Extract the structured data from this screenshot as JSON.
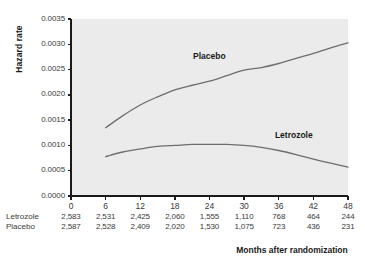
{
  "chart_data": {
    "type": "line",
    "title": "",
    "xlabel": "Months after randomization",
    "ylabel": "Hazard rate",
    "xlim": [
      0,
      48
    ],
    "ylim": [
      0.0,
      0.0035
    ],
    "grid": false,
    "legend_position": "inline-annotations",
    "xticks": [
      "0",
      "6",
      "12",
      "18",
      "24",
      "30",
      "36",
      "42",
      "48"
    ],
    "xtick_values": [
      0,
      6,
      12,
      18,
      24,
      30,
      36,
      42,
      48
    ],
    "yticks": [
      "0.0000",
      "0.0005",
      "0.0010",
      "0.0015",
      "0.0020",
      "0.0025",
      "0.0030",
      "0.0035"
    ],
    "ytick_values": [
      0.0,
      0.0005,
      0.001,
      0.0015,
      0.002,
      0.0025,
      0.003,
      0.0035
    ],
    "series": [
      {
        "name": "Placebo",
        "label": "Placebo",
        "color": "#6e6e6e",
        "x": [
          6,
          9,
          12,
          15,
          18,
          21,
          24,
          27,
          30,
          33,
          36,
          39,
          42,
          45,
          48
        ],
        "values": [
          0.00135,
          0.00159,
          0.0018,
          0.00196,
          0.0021,
          0.00219,
          0.00227,
          0.00238,
          0.00249,
          0.00254,
          0.00262,
          0.00272,
          0.00282,
          0.00293,
          0.00303
        ]
      },
      {
        "name": "Letrozole",
        "label": "Letrozole",
        "color": "#6e6e6e",
        "x": [
          6,
          9,
          12,
          15,
          18,
          21,
          24,
          27,
          30,
          33,
          36,
          39,
          42,
          45,
          48
        ],
        "values": [
          0.00078,
          0.00087,
          0.00093,
          0.00098,
          0.001,
          0.00102,
          0.00102,
          0.00102,
          0.001,
          0.00096,
          0.0009,
          0.00082,
          0.00073,
          0.00065,
          0.00057
        ]
      }
    ],
    "annotations": [
      {
        "text": "Placebo",
        "x": 24,
        "y": 0.00276
      },
      {
        "text": "Letrozole",
        "x": 39,
        "y": 0.0012
      }
    ]
  },
  "risk_table": {
    "rows": [
      {
        "label": "Letrozole",
        "values": [
          "2,583",
          "2,531",
          "2,425",
          "2,060",
          "1,555",
          "1,110",
          "768",
          "464",
          "244"
        ]
      },
      {
        "label": "Placebo",
        "values": [
          "2,587",
          "2,528",
          "2,409",
          "2,020",
          "1,530",
          "1,075",
          "723",
          "436",
          "231"
        ]
      }
    ]
  },
  "style": {
    "plot_background": "#ebebeb",
    "axis_color": "#1a1a1a",
    "line_color": "#6e6e6e",
    "page_background": "#ffffff"
  }
}
